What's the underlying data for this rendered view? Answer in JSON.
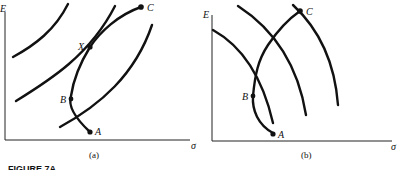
{
  "figure": {
    "caption_prefix": "FIGURE 7A",
    "panels": [
      {
        "id": "a",
        "label": "(a)",
        "y_axis_label": "E",
        "x_axis_label": "σ",
        "points": [
          {
            "name": "A"
          },
          {
            "name": "B"
          },
          {
            "name": "X"
          },
          {
            "name": "C"
          }
        ],
        "description": "Efficient frontier A-B-X-C with upward-sloping indifference curves; tangency at X"
      },
      {
        "id": "b",
        "label": "(b)",
        "y_axis_label": "E",
        "x_axis_label": "σ",
        "points": [
          {
            "name": "A"
          },
          {
            "name": "B"
          },
          {
            "name": "C"
          }
        ],
        "description": "Efficient frontier A-B-C with downward-sloping indifference curves"
      }
    ]
  }
}
